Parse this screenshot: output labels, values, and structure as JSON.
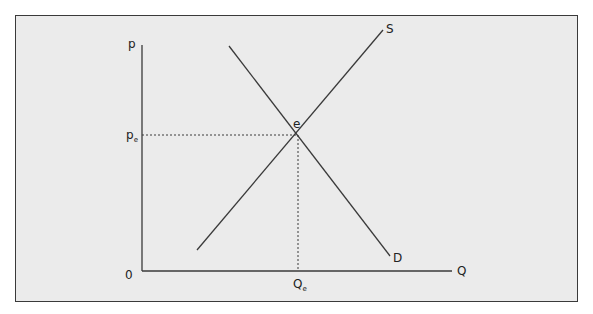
{
  "diagram": {
    "title": "",
    "axes": {
      "y_label": "p",
      "x_label": "Q",
      "origin_label": "0"
    },
    "curves": {
      "supply_label": "S",
      "demand_label": "D"
    },
    "equilibrium": {
      "point_label": "e",
      "price_label_main": "p",
      "price_label_sub": "e",
      "quantity_label_main": "Q",
      "quantity_label_sub": "e"
    },
    "colors": {
      "background": "#ebebeb",
      "line": "#3a3a3a",
      "border": "#3a3a3a"
    }
  }
}
